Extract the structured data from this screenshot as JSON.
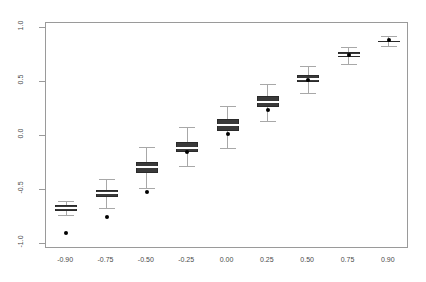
{
  "chart_data": {
    "type": "boxplot",
    "title": "",
    "subtitle": "",
    "xlabel": "",
    "ylabel": "",
    "xlim": [
      -1.05,
      1.05
    ],
    "ylim": [
      -1.05,
      1.05
    ],
    "grid": false,
    "legend": null,
    "frame": true,
    "categories": [
      "-0.90",
      "-0.75",
      "-0.50",
      "-0.25",
      "0.00",
      "0.25",
      "0.50",
      "0.75",
      "0.90"
    ],
    "x_tick_labels": [
      "-0.90",
      "-0.75",
      "-0.50",
      "-0.25",
      "0.00",
      "0.25",
      "0.50",
      "0.75",
      "0.90"
    ],
    "y_tick_labels": [
      "1.0",
      "0.5",
      "0.0",
      "-0.5",
      "-1.0"
    ],
    "y_ticks": [
      1.0,
      0.5,
      0.0,
      -0.5,
      -1.0
    ],
    "box_fill_color": "#3a3a3a",
    "median_color": "#ffffff",
    "whisker_color": "#a8a8a8",
    "point_color": "#000000",
    "axis_color": "#9a9a9a",
    "text_color": "#4a4a4a",
    "boxes": [
      {
        "category": "-0.90",
        "x": -0.9,
        "lower_whisker": -0.73,
        "q1": -0.7,
        "median": -0.67,
        "q3": -0.64,
        "upper_whisker": -0.6,
        "truth": -0.9
      },
      {
        "category": "-0.75",
        "x": -0.75,
        "lower_whisker": -0.67,
        "q1": -0.57,
        "median": -0.53,
        "q3": -0.5,
        "upper_whisker": -0.4,
        "truth": -0.75
      },
      {
        "category": "-0.50",
        "x": -0.5,
        "lower_whisker": -0.48,
        "q1": -0.34,
        "median": -0.29,
        "q3": -0.24,
        "upper_whisker": -0.1,
        "truth": -0.52
      },
      {
        "category": "-0.25",
        "x": -0.25,
        "lower_whisker": -0.28,
        "q1": -0.15,
        "median": -0.11,
        "q3": -0.06,
        "upper_whisker": 0.08,
        "truth": -0.15
      },
      {
        "category": "0.00",
        "x": 0.0,
        "lower_whisker": -0.11,
        "q1": 0.05,
        "median": 0.1,
        "q3": 0.16,
        "upper_whisker": 0.28,
        "truth": 0.02
      },
      {
        "category": "0.25",
        "x": 0.25,
        "lower_whisker": 0.14,
        "q1": 0.27,
        "median": 0.32,
        "q3": 0.37,
        "upper_whisker": 0.48,
        "truth": 0.24
      },
      {
        "category": "0.50",
        "x": 0.5,
        "lower_whisker": 0.4,
        "q1": 0.5,
        "median": 0.53,
        "q3": 0.57,
        "upper_whisker": 0.65,
        "truth": 0.52
      },
      {
        "category": "0.75",
        "x": 0.75,
        "lower_whisker": 0.67,
        "q1": 0.73,
        "median": 0.75,
        "q3": 0.78,
        "upper_whisker": 0.83,
        "truth": 0.75
      },
      {
        "category": "0.90",
        "x": 0.9,
        "lower_whisker": 0.84,
        "q1": 0.87,
        "median": 0.89,
        "q3": 0.9,
        "upper_whisker": 0.93,
        "truth": 0.89
      }
    ]
  }
}
